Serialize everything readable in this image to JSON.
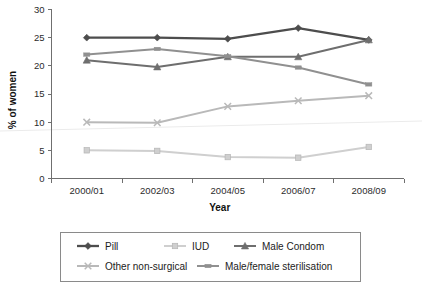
{
  "chart_data": {
    "type": "line",
    "title": "",
    "xlabel": "Year",
    "ylabel": "% of women",
    "categories": [
      "2000/01",
      "2002/03",
      "2004/05",
      "2006/07",
      "2008/09"
    ],
    "ylim": [
      0,
      30
    ],
    "yticks": [
      0,
      5,
      10,
      15,
      20,
      25,
      30
    ],
    "grid": false,
    "legend_position": "bottom",
    "series": [
      {
        "name": "Pill",
        "marker": "diamond",
        "color": "#4d4d4d",
        "values": [
          25.0,
          25.0,
          24.8,
          26.7,
          24.6
        ]
      },
      {
        "name": "IUD",
        "marker": "square",
        "color": "#cfcfcf",
        "values": [
          5.0,
          4.9,
          3.8,
          3.7,
          5.6
        ]
      },
      {
        "name": "Male Condom",
        "marker": "triangle",
        "color": "#6e6e6e",
        "values": [
          21.0,
          19.8,
          21.6,
          21.6,
          24.6
        ]
      },
      {
        "name": "Other non-surgical",
        "marker": "cross",
        "color": "#b9b9b9",
        "values": [
          10.0,
          9.9,
          12.8,
          13.8,
          14.7
        ]
      },
      {
        "name": "Male/female sterilisation",
        "marker": "dash",
        "color": "#909090",
        "values": [
          22.0,
          23.0,
          21.7,
          19.7,
          16.7
        ]
      }
    ]
  },
  "axes": {
    "y_tick_labels": [
      "30",
      "25",
      "20",
      "15",
      "10",
      "5",
      "0"
    ],
    "y_axis_title": "% of women",
    "x_axis_title": "Year",
    "x_tick_labels": [
      "2000/01",
      "2002/03",
      "2004/05",
      "2006/07",
      "2008/09"
    ]
  },
  "legend": {
    "rows": [
      [
        {
          "label": "Pill",
          "marker": "diamond",
          "color": "#4d4d4d"
        },
        {
          "label": "IUD",
          "marker": "square",
          "color": "#cfcfcf"
        },
        {
          "label": "Male Condom",
          "marker": "triangle",
          "color": "#6e6e6e"
        }
      ],
      [
        {
          "label": "Other non-surgical",
          "marker": "cross",
          "color": "#b9b9b9"
        },
        {
          "label": "Male/female sterilisation",
          "marker": "dash",
          "color": "#909090"
        }
      ]
    ]
  }
}
